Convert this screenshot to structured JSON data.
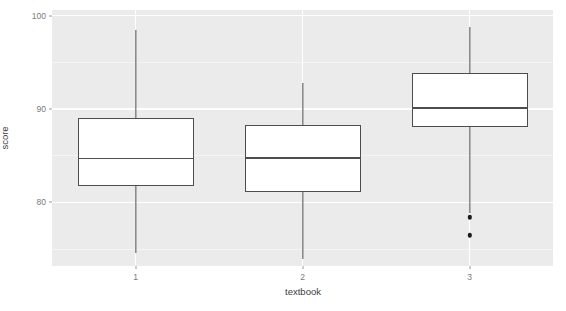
{
  "chart_data": {
    "type": "box",
    "title": "",
    "xlabel": "textbook",
    "ylabel": "score",
    "categories": [
      "1",
      "2",
      "3"
    ],
    "xtick_labels": [
      "1",
      "2",
      "3"
    ],
    "ytick_labels": [
      "100",
      "90",
      "80"
    ],
    "ytick_values": [
      100,
      90,
      80
    ],
    "ylim": [
      73.2,
      100.6
    ],
    "y_major_gridlines": [
      100,
      90,
      80
    ],
    "y_minor_gridlines": [
      95,
      85,
      75
    ],
    "grid": "on",
    "legend": "none",
    "panel_background": "#ebebeb",
    "gridline_color": "#ffffff",
    "box_fill": "#ffffff",
    "box_line_color": "#4d4d4d",
    "outlier_color": "#1a1a1a",
    "boxes": [
      {
        "category": "1",
        "whisker_low": 74.6,
        "q1": 81.8,
        "median": 84.7,
        "q3": 89.0,
        "whisker_high": 98.5,
        "outliers": []
      },
      {
        "category": "2",
        "whisker_low": 74.0,
        "q1": 81.1,
        "median": 84.8,
        "q3": 88.3,
        "whisker_high": 92.8,
        "outliers": []
      },
      {
        "category": "3",
        "whisker_low": 78.9,
        "q1": 88.1,
        "median": 90.1,
        "q3": 93.9,
        "whisker_high": 98.8,
        "outliers": [
          78.4,
          76.5
        ]
      }
    ]
  },
  "axes": {
    "y_title": "score",
    "x_title": "textbook"
  }
}
